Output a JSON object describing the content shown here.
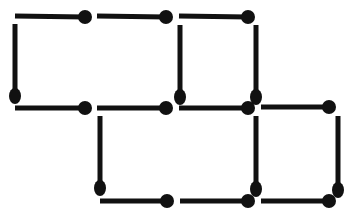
{
  "image": {
    "kind": "matchstick-puzzle-figure",
    "title": "Matchstick figure",
    "width": 353,
    "height": 217,
    "background_color": "#ffffff",
    "match_color": "#111111"
  },
  "geometry": {
    "unit_cell_width": 82,
    "unit_cell_height": 92,
    "stick_thickness": 5,
    "head_radius_x": 7,
    "head_radius_y": 8,
    "columns_x": [
      15,
      97,
      180,
      262,
      338
    ],
    "rows_y": [
      16,
      108,
      201
    ]
  },
  "counts": {
    "total_matches": 25,
    "horizontal_matches": 10,
    "vertical_matches": 6,
    "squares_formed": 3
  },
  "matches": [
    {
      "id": "h1",
      "orientation": "horizontal",
      "tail_x": 15,
      "tail_y": 16,
      "head_x": 85,
      "head_y": 17,
      "row": "top",
      "label": "top-row-match-1"
    },
    {
      "id": "h2",
      "orientation": "horizontal",
      "tail_x": 97,
      "tail_y": 16,
      "head_x": 166,
      "head_y": 17,
      "row": "top",
      "label": "top-row-match-2"
    },
    {
      "id": "h3",
      "orientation": "horizontal",
      "tail_x": 179,
      "tail_y": 16,
      "head_x": 248,
      "head_y": 17,
      "row": "top",
      "label": "top-row-match-3"
    },
    {
      "id": "v1",
      "orientation": "vertical",
      "tail_x": 15,
      "tail_y": 24,
      "head_x": 15,
      "head_y": 96,
      "column": "left",
      "label": "upper-vertical-left"
    },
    {
      "id": "v2",
      "orientation": "vertical",
      "tail_x": 180,
      "tail_y": 25,
      "head_x": 180,
      "head_y": 97,
      "column": "middle",
      "label": "upper-vertical-middle"
    },
    {
      "id": "v3",
      "orientation": "vertical",
      "tail_x": 256,
      "tail_y": 25,
      "head_x": 256,
      "head_y": 97,
      "column": "right",
      "label": "upper-vertical-right"
    },
    {
      "id": "h4",
      "orientation": "horizontal",
      "tail_x": 15,
      "tail_y": 108,
      "head_x": 85,
      "head_y": 108,
      "row": "middle",
      "label": "middle-row-match-1"
    },
    {
      "id": "h5",
      "orientation": "horizontal",
      "tail_x": 97,
      "tail_y": 108,
      "head_x": 166,
      "head_y": 108,
      "row": "middle",
      "label": "middle-row-match-2"
    },
    {
      "id": "h6",
      "orientation": "horizontal",
      "tail_x": 179,
      "tail_y": 108,
      "head_x": 248,
      "head_y": 108,
      "row": "middle",
      "label": "middle-row-match-3"
    },
    {
      "id": "h7",
      "orientation": "horizontal",
      "tail_x": 261,
      "tail_y": 107,
      "head_x": 329,
      "head_y": 107,
      "row": "middle",
      "label": "middle-row-match-4"
    },
    {
      "id": "v4",
      "orientation": "vertical",
      "tail_x": 100,
      "tail_y": 116,
      "head_x": 100,
      "head_y": 188,
      "column": "left",
      "label": "lower-vertical-left"
    },
    {
      "id": "v5",
      "orientation": "vertical",
      "tail_x": 256,
      "tail_y": 116,
      "head_x": 256,
      "head_y": 189,
      "column": "middle",
      "label": "lower-vertical-middle"
    },
    {
      "id": "v6",
      "orientation": "vertical",
      "tail_x": 338,
      "tail_y": 116,
      "head_x": 338,
      "head_y": 190,
      "column": "right",
      "label": "lower-vertical-right"
    },
    {
      "id": "h8",
      "orientation": "horizontal",
      "tail_x": 100,
      "tail_y": 201,
      "head_x": 167,
      "head_y": 201,
      "row": "bottom",
      "label": "bottom-row-match-1"
    },
    {
      "id": "h9",
      "orientation": "horizontal",
      "tail_x": 180,
      "tail_y": 201,
      "head_x": 248,
      "head_y": 201,
      "row": "bottom",
      "label": "bottom-row-match-2"
    },
    {
      "id": "h10",
      "orientation": "horizontal",
      "tail_x": 261,
      "tail_y": 201,
      "head_x": 329,
      "head_y": 201,
      "row": "bottom",
      "label": "bottom-row-match-3"
    }
  ]
}
